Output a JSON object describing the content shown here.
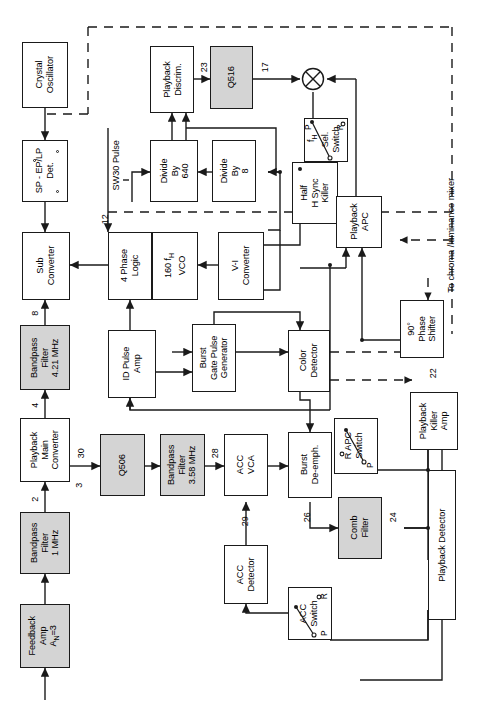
{
  "diagram": {
    "orientation": "rotated-90",
    "colors": {
      "line": "#1a1a1a",
      "shade": "#d4d4d4",
      "paper": "#ffffff"
    },
    "blocks": [
      {
        "id": "crystal-oscillator",
        "label": "Crystal\nOscillator",
        "shaded": false
      },
      {
        "id": "sp-ep-lp-det",
        "label": "SP - EP/LP\nDet.",
        "shaded": false
      },
      {
        "id": "sub-converter",
        "label": "Sub\nConverter",
        "shaded": false
      },
      {
        "id": "bandpass-filter-421",
        "label": "Bandpass\nFilter\n4.21 MHz",
        "shaded": true
      },
      {
        "id": "playback-main-converter",
        "label": "Playback\nMain\nConverter",
        "shaded": false
      },
      {
        "id": "bandpass-filter-1",
        "label": "Bandpass\nFilter\n1 MHz",
        "shaded": true
      },
      {
        "id": "feedback-amp",
        "label": "Feedback\nAmp\nAV=3",
        "shaded": true
      },
      {
        "id": "playback-discrim",
        "label": "Playback\nDiscrim.",
        "shaded": false
      },
      {
        "id": "q516",
        "label": "Q516",
        "shaded": true
      },
      {
        "id": "divide-by-640",
        "label": "Divide\nBy\n640",
        "shaded": false
      },
      {
        "id": "divide-by-8",
        "label": "Divide\nBy\n8",
        "shaded": false
      },
      {
        "id": "four-phase-logic",
        "label": "4 Phase\nLogic",
        "shaded": false
      },
      {
        "id": "vco-160fh",
        "label": "160 fH\nVCO",
        "shaded": false
      },
      {
        "id": "vi-converter",
        "label": "V-I\nConverter",
        "shaded": false
      },
      {
        "id": "half-h-sync-killer",
        "label": "Half\nH Sync\nKiller",
        "shaded": false
      },
      {
        "id": "sel-switch",
        "label": "Sel.\nSwitch",
        "shaded": false
      },
      {
        "id": "playback-apc",
        "label": "Playback\nAPC",
        "shaded": false
      },
      {
        "id": "id-pulse-amp",
        "label": "ID Pulse\nAmp",
        "shaded": false
      },
      {
        "id": "burst-gate-pulse-generator",
        "label": "Burst\nGate Pulse\nGenerator",
        "shaded": false
      },
      {
        "id": "color-detector",
        "label": "Color\nDetector",
        "shaded": false
      },
      {
        "id": "phase-shifter-90",
        "label": "90°\nPhase\nShifter",
        "shaded": false
      },
      {
        "id": "playback-killer-amp",
        "label": "Playback\nKiller\nAmp",
        "shaded": false
      },
      {
        "id": "q506",
        "label": "Q506",
        "shaded": true
      },
      {
        "id": "bandpass-filter-358",
        "label": "Bandpass\nFilter\n3.58 MHz",
        "shaded": true
      },
      {
        "id": "acc-vca",
        "label": "ACC\nVCA",
        "shaded": false
      },
      {
        "id": "burst-de-emph",
        "label": "Burst\nDe-emph.",
        "shaded": false
      },
      {
        "id": "acc-detector",
        "label": "ACC\nDetector",
        "shaded": false
      },
      {
        "id": "comb-filter",
        "label": "Comb\nFilter",
        "shaded": true
      },
      {
        "id": "acc-switch",
        "label": "ACC\nSwitch",
        "shaded": false
      },
      {
        "id": "r-apc-switch",
        "label": "R APC\nSwitch",
        "shaded": false
      },
      {
        "id": "playback-detector",
        "label": "Playback Detector",
        "shaded": false
      }
    ],
    "labels": {
      "crystal_oscillator": "Crystal",
      "crystal_oscillator_2": "Oscillator",
      "sp_ep_lp": "SP - EP/LP",
      "sp_ep_lp_2": "Det.",
      "sub_converter": "Sub",
      "sub_converter_2": "Converter",
      "bpf_421_1": "Bandpass",
      "bpf_421_2": "Filter",
      "bpf_421_3": "4.21 MHz",
      "pmc_1": "Playback",
      "pmc_2": "Main",
      "pmc_3": "Converter",
      "bpf_1_1": "Bandpass",
      "bpf_1_2": "Filter",
      "bpf_1_3": "1 MHz",
      "fb_amp_1": "Feedback",
      "fb_amp_2": "Amp",
      "fb_amp_3": "A",
      "fb_amp_3sub": "N",
      "fb_amp_3b": "=3",
      "pb_discrim_1": "Playback",
      "pb_discrim_2": "Discrim.",
      "q516": "Q516",
      "div640_1": "Divide",
      "div640_2": "By",
      "div640_3": "640",
      "div8_1": "Divide",
      "div8_2": "By",
      "div8_3": "8",
      "phase4_1": "4 Phase",
      "phase4_2": "Logic",
      "vco_1": "160 f",
      "vco_1sub": "H",
      "vco_2": "VCO",
      "vi_1": "V-I",
      "vi_2": "Converter",
      "hsync_1": "Half",
      "hsync_2": "H Sync",
      "hsync_3": "Killer",
      "sel_switch_1": "Sel.",
      "sel_switch_2": "Switch",
      "sel_switch_p": "P",
      "sel_switch_r": "R",
      "pb_apc_1": "Playback",
      "pb_apc_2": "APC",
      "id_pulse_1": "ID Pulse",
      "id_pulse_2": "Amp",
      "bgpg_1": "Burst",
      "bgpg_2": "Gate Pulse",
      "bgpg_3": "Generator",
      "color_det_1": "Color",
      "color_det_2": "Detector",
      "ps90_1": "90°",
      "ps90_2": "Phase",
      "ps90_3": "Shifter",
      "pka_1": "Playback",
      "pka_2": "Killer",
      "pka_3": "Amp",
      "q506": "Q506",
      "bpf_358_1": "Bandpass",
      "bpf_358_2": "Filter",
      "bpf_358_3": "3.58 MHz",
      "acc_vca_1": "ACC",
      "acc_vca_2": "VCA",
      "burst_de_1": "Burst",
      "burst_de_2": "De-emph.",
      "acc_det_1": "ACC",
      "acc_det_2": "Detector",
      "comb_1": "Comb",
      "comb_2": "Filter",
      "acc_switch_1": "ACC",
      "acc_switch_2": "Switch",
      "acc_switch_r": "R",
      "acc_switch_p": "P",
      "rapc_1": "R",
      "rapc_1b": " APC",
      "rapc_2": "Switch",
      "rapc_p": "P",
      "pb_detector": "Playback Detector",
      "sw30_pulse": "SW30 Pulse",
      "fh_label": "f",
      "fh_label_sub": "H",
      "to_mixer": "To chroma /luminance mixer"
    },
    "pin_numbers": {
      "n8": "8",
      "n4": "4",
      "n2": "2",
      "n3": "3",
      "n30": "30",
      "n12": "12",
      "n23": "23",
      "n17": "17",
      "n28": "28",
      "n29": "29",
      "n26": "26",
      "n24": "24",
      "n22": "22"
    }
  }
}
